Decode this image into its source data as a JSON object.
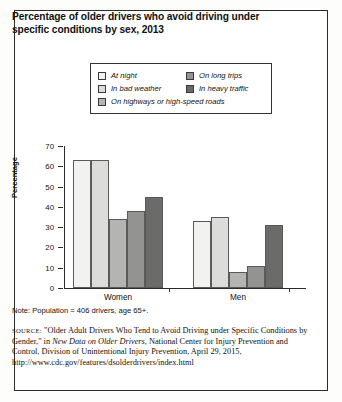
{
  "title": "Percentage of older drivers who avoid driving under specific conditions by sex, 2013",
  "legend": {
    "items": [
      {
        "label": "At night",
        "color": "#f2f2f0",
        "column": "left"
      },
      {
        "label": "In bad weather",
        "color": "#dcdcda",
        "column": "left"
      },
      {
        "label": "On highways or high-speed roads",
        "color": "#b4b4b2",
        "column": "left"
      },
      {
        "label": "On long trips",
        "color": "#939391",
        "column": "right"
      },
      {
        "label": "In heavy traffic",
        "color": "#6b6b69",
        "column": "right"
      }
    ]
  },
  "note": "Note: Population = 406 drivers, age 65+.",
  "source": {
    "label": "SOURCE:",
    "text_1": "\"Older Adult Drivers Who Tend to Avoid Driving under Specific Conditions by Gender,\" in ",
    "italic_1": "New Data on Older Drivers,",
    "text_2": " National Center for Injury Prevention and Control, Division of Unintentional Injury Prevention, April 29, 2015, http://www.cdc.gov/features/dsolderdrivers/index.html"
  },
  "chart_data": {
    "type": "bar",
    "title": "Percentage of older drivers who avoid driving under specific conditions by sex, 2013",
    "xlabel": "",
    "ylabel": "Percentage",
    "ylim": [
      0,
      70
    ],
    "yticks": [
      0,
      10,
      20,
      30,
      40,
      50,
      60,
      70
    ],
    "grid": false,
    "legend_position": "top",
    "categories": [
      "Women",
      "Men"
    ],
    "series": [
      {
        "name": "At night",
        "values": [
          63,
          33
        ],
        "color": "#f2f2f0"
      },
      {
        "name": "In bad weather",
        "values": [
          63,
          35
        ],
        "color": "#dcdcda"
      },
      {
        "name": "On highways or high-speed roads",
        "values": [
          34,
          8
        ],
        "color": "#b4b4b2"
      },
      {
        "name": "On long trips",
        "values": [
          38,
          11
        ],
        "color": "#939391"
      },
      {
        "name": "In heavy traffic",
        "values": [
          45,
          31
        ],
        "color": "#6b6b69"
      }
    ]
  }
}
